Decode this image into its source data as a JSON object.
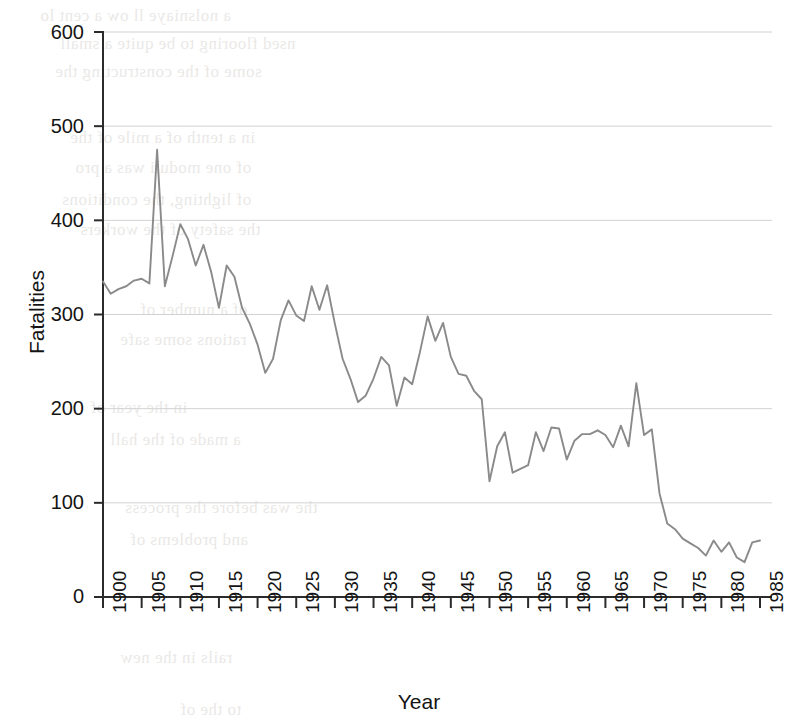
{
  "chart_data": {
    "type": "line",
    "title": "",
    "xlabel": "Year",
    "ylabel": "Fatalities",
    "xlim": [
      1900,
      1985
    ],
    "ylim": [
      0,
      600
    ],
    "grid": true,
    "legend": "none",
    "series_color": "#8a8a8a",
    "grid_color": "#d2d2d2",
    "axis_color": "#2b2b2b",
    "xticks": [
      "1900",
      "1905",
      "1910",
      "1915",
      "1920",
      "1925",
      "1930",
      "1935",
      "1940",
      "1945",
      "1950",
      "1955",
      "1960",
      "1965",
      "1970",
      "1975",
      "1980",
      "1985"
    ],
    "yticks": [
      "0",
      "100",
      "200",
      "300",
      "400",
      "500",
      "600"
    ],
    "x": [
      1900,
      1901,
      1902,
      1903,
      1904,
      1905,
      1906,
      1907,
      1908,
      1909,
      1910,
      1911,
      1912,
      1913,
      1914,
      1915,
      1916,
      1917,
      1918,
      1919,
      1920,
      1921,
      1922,
      1923,
      1924,
      1925,
      1926,
      1927,
      1928,
      1929,
      1930,
      1931,
      1932,
      1933,
      1934,
      1935,
      1936,
      1937,
      1938,
      1939,
      1940,
      1941,
      1942,
      1943,
      1944,
      1945,
      1946,
      1947,
      1948,
      1949,
      1950,
      1951,
      1952,
      1953,
      1954,
      1955,
      1956,
      1957,
      1958,
      1959,
      1960,
      1961,
      1962,
      1963,
      1964,
      1965,
      1966,
      1967,
      1968,
      1969,
      1970,
      1971,
      1972,
      1973,
      1974,
      1975,
      1976,
      1977,
      1978,
      1979,
      1980,
      1981,
      1982,
      1983,
      1984,
      1985
    ],
    "values": [
      335,
      322,
      327,
      330,
      336,
      338,
      333,
      475,
      330,
      362,
      396,
      380,
      352,
      374,
      345,
      307,
      352,
      340,
      307,
      290,
      268,
      238,
      253,
      294,
      315,
      299,
      293,
      330,
      305,
      331,
      290,
      253,
      232,
      207,
      214,
      232,
      255,
      246,
      203,
      233,
      226,
      260,
      298,
      272,
      291,
      255,
      237,
      235,
      219,
      210,
      123,
      160,
      175,
      132,
      136,
      140,
      175,
      155,
      180,
      179,
      146,
      166,
      173,
      173,
      177,
      172,
      159,
      182,
      160,
      227,
      172,
      178,
      110,
      78,
      72,
      62,
      57,
      52,
      44,
      60,
      48,
      58,
      42,
      37,
      58,
      60
    ]
  }
}
